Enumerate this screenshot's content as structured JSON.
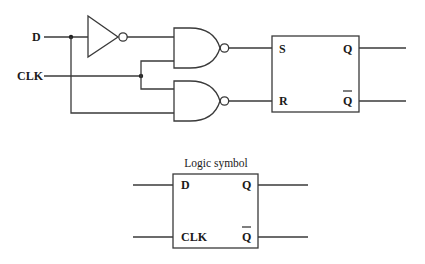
{
  "circuit": {
    "inputs": {
      "d_label": "D",
      "clk_label": "CLK"
    },
    "components": [
      {
        "type": "inverter",
        "name": "NOT gate"
      },
      {
        "type": "nand",
        "name": "NAND gate 1"
      },
      {
        "type": "nand",
        "name": "NAND gate 2"
      },
      {
        "type": "sr-latch",
        "name": "SR latch"
      }
    ],
    "sr_latch": {
      "s_label": "S",
      "r_label": "R",
      "q_label": "Q",
      "qbar_label": "Q"
    }
  },
  "logic_symbol": {
    "title": "Logic symbol",
    "d_label": "D",
    "clk_label": "CLK",
    "q_label": "Q",
    "qbar_label": "Q"
  },
  "colors": {
    "line": "#3a3a3a",
    "text": "#1a1a1a",
    "background": "#ffffff"
  }
}
